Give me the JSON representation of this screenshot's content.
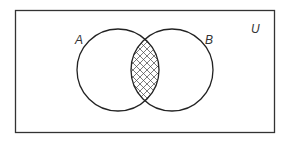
{
  "diagram": {
    "type": "venn",
    "universe_label": "U",
    "sets": [
      {
        "label": "A",
        "cx": 118,
        "cy": 70,
        "r": 41
      },
      {
        "label": "B",
        "cx": 172,
        "cy": 70,
        "r": 41
      }
    ],
    "shaded_region": "A ∩ B",
    "shading_style": "crosshatch",
    "colors": {
      "stroke": "#222222",
      "hatch": "#444444",
      "background": "#ffffff"
    }
  }
}
